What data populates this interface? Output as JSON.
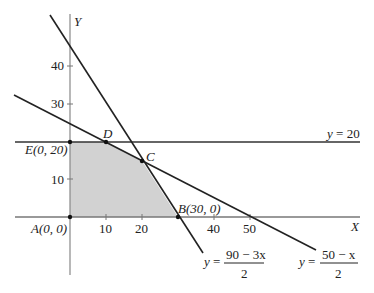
{
  "diagram": {
    "type": "linear-programming-feasible-region",
    "axes": {
      "x_label": "X",
      "y_label": "Y",
      "x_ticks": [
        "10",
        "20",
        "40",
        "50"
      ],
      "y_ticks": [
        "10",
        "30",
        "40"
      ]
    },
    "lines": [
      {
        "id": "line-y20",
        "label": "y = 20",
        "eq_lhs": "y =",
        "value": "20"
      },
      {
        "id": "line-steep",
        "eq_lhs": "y =",
        "numerator": "90 − 3x",
        "denominator": "2"
      },
      {
        "id": "line-shallow",
        "eq_lhs": "y =",
        "numerator": "50 − x",
        "denominator": "2"
      }
    ],
    "points": {
      "A": "A(0, 0)",
      "B": "B(30, 0)",
      "C": "C",
      "D": "D",
      "E": "E(0, 20)"
    },
    "colors": {
      "region_fill": "#cfcfcf",
      "line": "#222222",
      "axis": "#777777"
    }
  }
}
